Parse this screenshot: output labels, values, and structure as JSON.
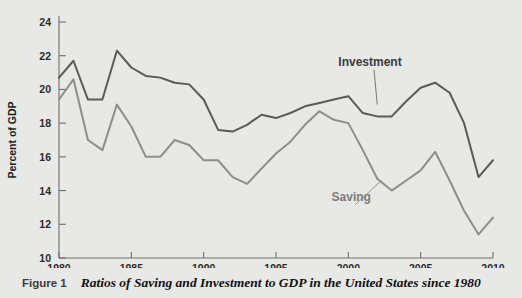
{
  "figure": {
    "caption_label": "Figure 1",
    "caption_title": "Ratios of Saving and Investment to GDP in the United States since 1980"
  },
  "colors": {
    "background": "#e8e8e6",
    "investment": "#5a5a5a",
    "saving": "#8d8d8d",
    "axis": "#6e6e6e"
  },
  "annotations": {
    "investment_label": "Investment",
    "saving_label": "Saving"
  },
  "chart_data": {
    "type": "line",
    "title": "Ratios of Saving and Investment to GDP in the United States since 1980",
    "xlabel": "",
    "ylabel": "Percent of GDP",
    "xlim": [
      1980,
      2010
    ],
    "ylim": [
      10,
      24
    ],
    "xticks": [
      1980,
      1985,
      1990,
      1995,
      2000,
      2005,
      2010
    ],
    "xticklabels": [
      "1980",
      "1985",
      "1990",
      "1995",
      "2000",
      "2005",
      "2010"
    ],
    "yticks": [
      10,
      12,
      14,
      16,
      18,
      20,
      22,
      24
    ],
    "yticklabels": [
      "10",
      "12",
      "14",
      "16",
      "18",
      "20",
      "22",
      "24"
    ],
    "grid": false,
    "legend": "inline-annotations",
    "x": [
      1980,
      1981,
      1982,
      1983,
      1984,
      1985,
      1986,
      1987,
      1988,
      1989,
      1990,
      1991,
      1992,
      1993,
      1994,
      1995,
      1996,
      1997,
      1998,
      1999,
      2000,
      2001,
      2002,
      2003,
      2004,
      2005,
      2006,
      2007,
      2008,
      2009,
      2010
    ],
    "series": [
      {
        "name": "Investment",
        "color": "#5a5a5a",
        "values": [
          20.7,
          21.7,
          19.4,
          19.4,
          22.3,
          21.3,
          20.8,
          20.7,
          20.4,
          20.3,
          19.4,
          17.6,
          17.5,
          17.9,
          18.5,
          18.3,
          18.6,
          19.0,
          19.2,
          19.4,
          19.6,
          18.6,
          18.4,
          18.4,
          19.3,
          20.1,
          20.4,
          19.8,
          18.0,
          14.8,
          15.8
        ]
      },
      {
        "name": "Saving",
        "color": "#8d8d8d",
        "values": [
          19.4,
          20.6,
          17.0,
          16.4,
          19.1,
          17.8,
          16.0,
          16.0,
          17.0,
          16.7,
          15.8,
          15.8,
          14.8,
          14.4,
          15.3,
          16.2,
          16.9,
          17.9,
          18.7,
          18.2,
          18.0,
          16.4,
          14.7,
          14.0,
          14.6,
          15.2,
          16.3,
          14.6,
          12.8,
          11.4,
          12.4
        ]
      }
    ],
    "annotations": [
      {
        "text": "Investment",
        "x": 2001.5,
        "y": 21.4,
        "points_to": [
          2002.0,
          19.1
        ]
      },
      {
        "text": "Saving",
        "x": 2000.2,
        "y": 13.4,
        "points_to": [
          2002.3,
          14.6
        ]
      }
    ]
  }
}
